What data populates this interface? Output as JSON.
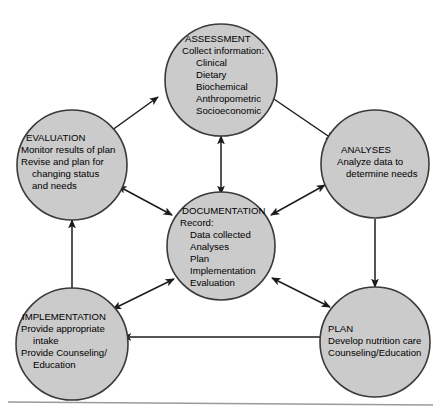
{
  "diagram": {
    "fill_color": "#cbcbcb",
    "stroke_color": "#3a3a3a",
    "connector_color": "#1c1c1c",
    "nodes": {
      "assessment": {
        "heading": "ASSESSMENT",
        "lines": [
          "Collect information:",
          "Clinical",
          "Dietary",
          "Biochemical",
          "Anthropometric",
          "Socioeconomic"
        ]
      },
      "analyses": {
        "heading": "ANALYSES",
        "lines": [
          "Analyze data to",
          "determine needs"
        ]
      },
      "plan": {
        "heading": "PLAN",
        "lines": [
          "Develop nutrition care",
          "Counseling/Education"
        ]
      },
      "implementation": {
        "heading": "IMPLEMENTATION",
        "lines": [
          "Provide appropriate",
          "intake",
          "Provide Counseling/",
          "Education"
        ]
      },
      "evaluation": {
        "heading": "EVALUATION",
        "lines": [
          "Monitor results of plan",
          "Revise and plan for",
          "changing status",
          "and needs"
        ]
      },
      "documentation": {
        "heading": "DOCUMENTATION",
        "lines": [
          "Record:",
          "Data collected",
          "Analyses",
          "Plan",
          "Implementation",
          "Evaluation"
        ]
      }
    },
    "connectors": [
      {
        "name": "evaluation-to-assessment",
        "type": "single"
      },
      {
        "name": "assessment-to-analyses",
        "type": "single"
      },
      {
        "name": "analyses-to-plan",
        "type": "single"
      },
      {
        "name": "plan-to-implementation",
        "type": "single"
      },
      {
        "name": "implementation-to-evaluation",
        "type": "single"
      },
      {
        "name": "assessment-documentation",
        "type": "double"
      },
      {
        "name": "evaluation-documentation",
        "type": "double"
      },
      {
        "name": "analyses-documentation",
        "type": "double"
      },
      {
        "name": "implementation-documentation",
        "type": "double"
      },
      {
        "name": "plan-documentation",
        "type": "double"
      }
    ]
  }
}
